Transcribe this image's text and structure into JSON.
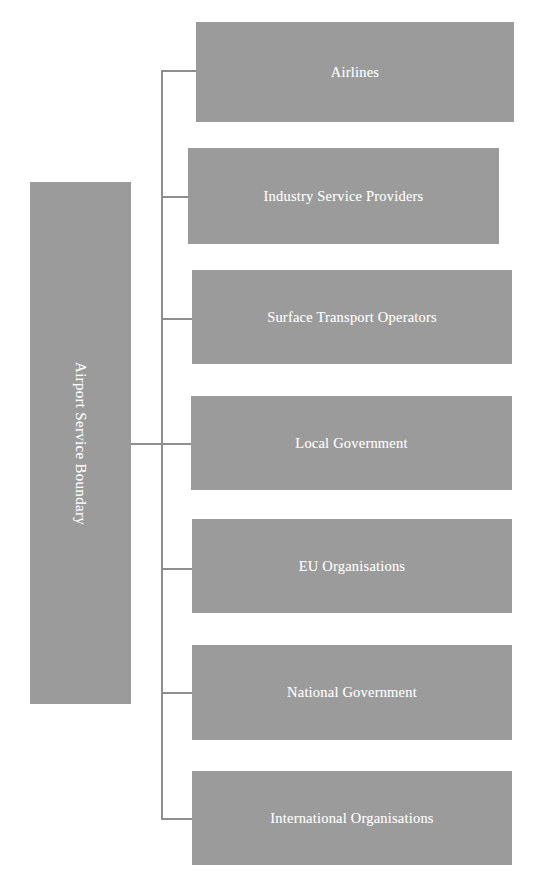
{
  "diagram": {
    "type": "hierarchy-tree",
    "orientation": "left-root-right-leaves",
    "root": {
      "label": "Airport Service Boundary",
      "text_rotation": "vertical-top-to-bottom"
    },
    "colors": {
      "box_fill": "#9b9b9b",
      "box_text": "#ffffff",
      "connector": "#8e8e8e",
      "background": "#ffffff"
    },
    "branches": [
      {
        "label": "Airlines"
      },
      {
        "label": "Industry Service Providers"
      },
      {
        "label": "Surface Transport Operators"
      },
      {
        "label": "Local Government"
      },
      {
        "label": "EU Organisations"
      },
      {
        "label": "National Government"
      },
      {
        "label": "International Organisations"
      }
    ]
  }
}
